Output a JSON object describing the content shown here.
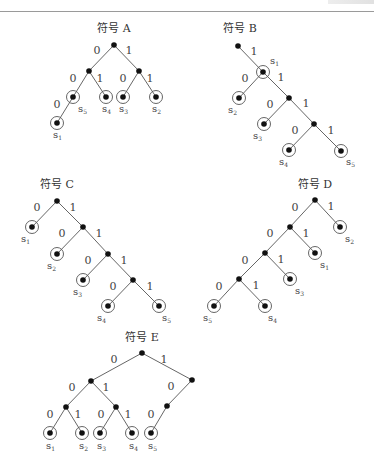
{
  "figure": {
    "trees": [
      {
        "id": "A",
        "title": "符号 A",
        "title_pos": [
          114,
          32
        ],
        "nodes": [
          {
            "id": "r",
            "x": 114,
            "y": 45
          },
          {
            "id": "L",
            "x": 89,
            "y": 71
          },
          {
            "id": "R",
            "x": 139,
            "y": 71
          },
          {
            "id": "s5",
            "x": 73,
            "y": 97,
            "leaf": true,
            "label": "s",
            "sub": "5",
            "lx": 78,
            "ly": 112
          },
          {
            "id": "s4",
            "x": 106,
            "y": 97,
            "leaf": true,
            "label": "s",
            "sub": "4",
            "lx": 102,
            "ly": 112
          },
          {
            "id": "s3",
            "x": 123,
            "y": 97,
            "leaf": true,
            "label": "s",
            "sub": "3",
            "lx": 119,
            "ly": 112
          },
          {
            "id": "s2",
            "x": 156,
            "y": 97,
            "leaf": true,
            "label": "s",
            "sub": "2",
            "lx": 152,
            "ly": 112
          },
          {
            "id": "s1",
            "x": 57,
            "y": 123,
            "leaf": true,
            "label": "s",
            "sub": "1",
            "lx": 53,
            "ly": 138
          }
        ],
        "edges": [
          {
            "from": "r",
            "to": "L",
            "bit": "0",
            "bx": 97,
            "by": 54
          },
          {
            "from": "r",
            "to": "R",
            "bit": "1",
            "bx": 129,
            "by": 54
          },
          {
            "from": "L",
            "to": "s5",
            "bit": "0",
            "bx": 73,
            "by": 82
          },
          {
            "from": "L",
            "to": "s4",
            "bit": "1",
            "bx": 100,
            "by": 82
          },
          {
            "from": "R",
            "to": "s3",
            "bit": "0",
            "bx": 123,
            "by": 82
          },
          {
            "from": "R",
            "to": "s2",
            "bit": "1",
            "bx": 150,
            "by": 82
          },
          {
            "from": "s5",
            "to": "s1",
            "bit": "0",
            "bx": 57,
            "by": 108
          }
        ]
      },
      {
        "id": "B",
        "title": "符号 B",
        "title_pos": [
          240,
          32
        ],
        "nodes": [
          {
            "id": "r",
            "x": 238,
            "y": 46
          },
          {
            "id": "s1",
            "x": 263,
            "y": 72,
            "leaf": true,
            "label": "s",
            "sub": "1",
            "lx": 270,
            "ly": 64
          },
          {
            "id": "s2",
            "x": 239,
            "y": 98,
            "leaf": true,
            "label": "s",
            "sub": "2",
            "lx": 228,
            "ly": 113
          },
          {
            "id": "n2",
            "x": 289,
            "y": 98
          },
          {
            "id": "s3",
            "x": 264,
            "y": 124,
            "leaf": true,
            "label": "s",
            "sub": "3",
            "lx": 253,
            "ly": 139
          },
          {
            "id": "n3",
            "x": 314,
            "y": 124
          },
          {
            "id": "s4",
            "x": 289,
            "y": 150,
            "leaf": true,
            "label": "s",
            "sub": "4",
            "lx": 279,
            "ly": 165
          },
          {
            "id": "s5",
            "x": 341,
            "y": 151,
            "leaf": true,
            "label": "s",
            "sub": "5",
            "lx": 346,
            "ly": 165
          }
        ],
        "edges": [
          {
            "from": "r",
            "to": "s1",
            "bit": "1",
            "bx": 254,
            "by": 55
          },
          {
            "from": "s1",
            "to": "s2",
            "bit": "0",
            "bx": 245,
            "by": 82
          },
          {
            "from": "s1",
            "to": "n2",
            "bit": "1",
            "bx": 281,
            "by": 81
          },
          {
            "from": "n2",
            "to": "s3",
            "bit": "0",
            "bx": 270,
            "by": 108
          },
          {
            "from": "n2",
            "to": "s3",
            "bit": "",
            "bx": 0,
            "by": 0
          },
          {
            "from": "n2",
            "to": "n3",
            "bit": "1",
            "bx": 306,
            "by": 107
          },
          {
            "from": "n3",
            "to": "s4",
            "bit": "0",
            "bx": 295,
            "by": 134
          },
          {
            "from": "n3",
            "to": "s5",
            "bit": "1",
            "bx": 331,
            "by": 134
          }
        ]
      },
      {
        "id": "C",
        "title": "符号 C",
        "title_pos": [
          57,
          188
        ],
        "nodes": [
          {
            "id": "r",
            "x": 57,
            "y": 201
          },
          {
            "id": "s1",
            "x": 32,
            "y": 227,
            "leaf": true,
            "label": "s",
            "sub": "1",
            "lx": 21,
            "ly": 242
          },
          {
            "id": "n1",
            "x": 83,
            "y": 227
          },
          {
            "id": "s2",
            "x": 57,
            "y": 254,
            "leaf": true,
            "label": "s",
            "sub": "2",
            "lx": 47,
            "ly": 269
          },
          {
            "id": "n2",
            "x": 108,
            "y": 254
          },
          {
            "id": "s3",
            "x": 83,
            "y": 280,
            "leaf": true,
            "label": "s",
            "sub": "3",
            "lx": 73,
            "ly": 295
          },
          {
            "id": "n3",
            "x": 133,
            "y": 280
          },
          {
            "id": "s4",
            "x": 108,
            "y": 306,
            "leaf": true,
            "label": "s",
            "sub": "4",
            "lx": 97,
            "ly": 321
          },
          {
            "id": "s5",
            "x": 159,
            "y": 306,
            "leaf": true,
            "label": "s",
            "sub": "5",
            "lx": 162,
            "ly": 321
          }
        ],
        "edges": [
          {
            "from": "r",
            "to": "s1",
            "bit": "0",
            "bx": 37,
            "by": 211
          },
          {
            "from": "r",
            "to": "n1",
            "bit": "1",
            "bx": 73,
            "by": 211
          },
          {
            "from": "n1",
            "to": "s2",
            "bit": "0",
            "bx": 62,
            "by": 237
          },
          {
            "from": "n1",
            "to": "n2",
            "bit": "1",
            "bx": 99,
            "by": 237
          },
          {
            "from": "n2",
            "to": "s3",
            "bit": "0",
            "bx": 88,
            "by": 264
          },
          {
            "from": "n2",
            "to": "n3",
            "bit": "1",
            "bx": 124,
            "by": 264
          },
          {
            "from": "n3",
            "to": "s4",
            "bit": "0",
            "bx": 113,
            "by": 290
          },
          {
            "from": "n3",
            "to": "s5",
            "bit": "1",
            "bx": 150,
            "by": 290
          }
        ]
      },
      {
        "id": "D",
        "title": "符号 D",
        "title_pos": [
          315,
          188
        ],
        "nodes": [
          {
            "id": "r",
            "x": 315,
            "y": 200
          },
          {
            "id": "s2",
            "x": 340,
            "y": 227,
            "leaf": true,
            "label": "s",
            "sub": "2",
            "lx": 345,
            "ly": 242
          },
          {
            "id": "n1",
            "x": 290,
            "y": 227
          },
          {
            "id": "s1",
            "x": 315,
            "y": 253,
            "leaf": true,
            "label": "s",
            "sub": "1",
            "lx": 320,
            "ly": 268
          },
          {
            "id": "n2",
            "x": 265,
            "y": 253
          },
          {
            "id": "s3",
            "x": 290,
            "y": 279,
            "leaf": true,
            "label": "s",
            "sub": "3",
            "lx": 295,
            "ly": 294
          },
          {
            "id": "n3",
            "x": 239,
            "y": 279
          },
          {
            "id": "s5",
            "x": 214,
            "y": 306,
            "leaf": true,
            "label": "s",
            "sub": "5",
            "lx": 203,
            "ly": 321
          },
          {
            "id": "s4",
            "x": 265,
            "y": 306,
            "leaf": true,
            "label": "s",
            "sub": "4",
            "lx": 268,
            "ly": 321
          }
        ],
        "edges": [
          {
            "from": "r",
            "to": "n1",
            "bit": "0",
            "bx": 295,
            "by": 211
          },
          {
            "from": "r",
            "to": "s2",
            "bit": "1",
            "bx": 331,
            "by": 210
          },
          {
            "from": "n1",
            "to": "n2",
            "bit": "0",
            "bx": 270,
            "by": 237
          },
          {
            "from": "n1",
            "to": "s1",
            "bit": "1",
            "bx": 306,
            "by": 237
          },
          {
            "from": "n2",
            "to": "n3",
            "bit": "0",
            "bx": 245,
            "by": 264
          },
          {
            "from": "n2",
            "to": "s3",
            "bit": "1",
            "bx": 281,
            "by": 263
          },
          {
            "from": "n3",
            "to": "s5",
            "bit": "0",
            "bx": 219,
            "by": 290
          },
          {
            "from": "n3",
            "to": "s4",
            "bit": "1",
            "bx": 256,
            "by": 289
          }
        ]
      },
      {
        "id": "E",
        "title": "符号 E",
        "title_pos": [
          142,
          341
        ],
        "nodes": [
          {
            "id": "r",
            "x": 142,
            "y": 353
          },
          {
            "id": "L",
            "x": 91,
            "y": 381
          },
          {
            "id": "R",
            "x": 192,
            "y": 380
          },
          {
            "id": "LL",
            "x": 66,
            "y": 407
          },
          {
            "id": "LR",
            "x": 116,
            "y": 407
          },
          {
            "id": "RL",
            "x": 167,
            "y": 406
          },
          {
            "id": "s1",
            "x": 50,
            "y": 433,
            "leaf": true,
            "label": "s",
            "sub": "1",
            "lx": 46,
            "ly": 449
          },
          {
            "id": "s2",
            "x": 82,
            "y": 433,
            "leaf": true,
            "label": "s",
            "sub": "2",
            "lx": 79,
            "ly": 449
          },
          {
            "id": "s3",
            "x": 100,
            "y": 433,
            "leaf": true,
            "label": "s",
            "sub": "3",
            "lx": 97,
            "ly": 449
          },
          {
            "id": "s4",
            "x": 132,
            "y": 433,
            "leaf": true,
            "label": "s",
            "sub": "4",
            "lx": 129,
            "ly": 449
          },
          {
            "id": "s5",
            "x": 151,
            "y": 433,
            "leaf": true,
            "label": "s",
            "sub": "5",
            "lx": 148,
            "ly": 449
          }
        ],
        "edges": [
          {
            "from": "r",
            "to": "L",
            "bit": "0",
            "bx": 114,
            "by": 363
          },
          {
            "from": "r",
            "to": "R",
            "bit": "1",
            "bx": 164,
            "by": 363
          },
          {
            "from": "L",
            "to": "LL",
            "bit": "0",
            "bx": 72,
            "by": 391
          },
          {
            "from": "L",
            "to": "LR",
            "bit": "1",
            "bx": 106,
            "by": 391
          },
          {
            "from": "R",
            "to": "RL",
            "bit": "0",
            "bx": 171,
            "by": 390
          },
          {
            "from": "LL",
            "to": "s1",
            "bit": "0",
            "bx": 50,
            "by": 418
          },
          {
            "from": "LL",
            "to": "s2",
            "bit": "1",
            "bx": 78,
            "by": 418
          },
          {
            "from": "LR",
            "to": "s3",
            "bit": "0",
            "bx": 101,
            "by": 418
          },
          {
            "from": "LR",
            "to": "s4",
            "bit": "1",
            "bx": 128,
            "by": 418
          },
          {
            "from": "RL",
            "to": "s5",
            "bit": "0",
            "bx": 151,
            "by": 418
          }
        ]
      }
    ]
  }
}
